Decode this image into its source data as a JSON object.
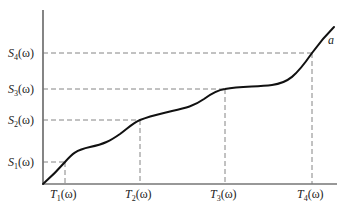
{
  "diagram": {
    "type": "monotone-staircase-curve",
    "curve_label": "a",
    "y_labels": [
      {
        "base": "S",
        "sub": "4",
        "arg": "(ω)",
        "y": 53
      },
      {
        "base": "S",
        "sub": "3",
        "arg": "(ω)",
        "y": 89
      },
      {
        "base": "S",
        "sub": "2",
        "arg": "(ω)",
        "y": 120
      },
      {
        "base": "S",
        "sub": "1",
        "arg": "(ω)",
        "y": 162
      }
    ],
    "x_labels": [
      {
        "base": "T",
        "sub": "1",
        "arg": "(ω)",
        "x": 65
      },
      {
        "base": "T",
        "sub": "2",
        "arg": "(ω)",
        "x": 140
      },
      {
        "base": "T",
        "sub": "3",
        "arg": "(ω)",
        "x": 225
      },
      {
        "base": "T",
        "sub": "4",
        "arg": "(ω)",
        "x": 312
      }
    ],
    "colors": {
      "curve": "#111111",
      "axis": "#333333",
      "dashed": "#777777",
      "text": "#222222"
    }
  }
}
